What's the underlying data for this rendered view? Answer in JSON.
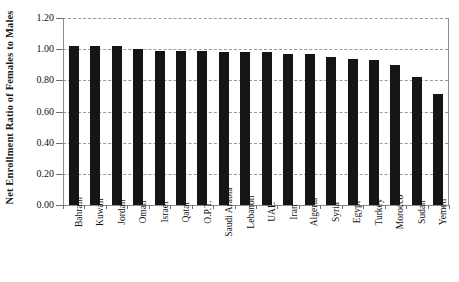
{
  "chart_data": {
    "type": "bar",
    "title": "",
    "subtitle": "",
    "xlabel": "",
    "ylabel": "Net Enrollment Ratio of Females to Males",
    "ylim": [
      0.0,
      1.2
    ],
    "ytick_labels": [
      "1.20",
      "1.00",
      "0.80",
      "0.60",
      "0.40",
      "0.20",
      "0.00"
    ],
    "ytick_values": [
      1.2,
      1.0,
      0.8,
      0.6,
      0.4,
      0.2,
      0.0
    ],
    "grid": true,
    "grid_style": "dashed-horizontal",
    "legend": false,
    "legend_position": "none",
    "bar_color": "#151515",
    "grid_color": "#9a9a9a",
    "axis_color": "#8d8d8d",
    "categories": [
      "Bahrain",
      "Kuwait",
      "Jordan",
      "Oman",
      "Israel",
      "Qatar",
      "O.P.T.",
      "Saudi Arabia",
      "Lebanon",
      "UAE",
      "Iran",
      "Algeria",
      "Syria",
      "Egypt",
      "Turkey",
      "Morocco",
      "Sudan",
      "Yemen"
    ],
    "values": [
      1.02,
      1.02,
      1.02,
      1.0,
      0.99,
      0.99,
      0.99,
      0.98,
      0.98,
      0.98,
      0.97,
      0.97,
      0.95,
      0.94,
      0.93,
      0.9,
      0.82,
      0.71
    ]
  }
}
